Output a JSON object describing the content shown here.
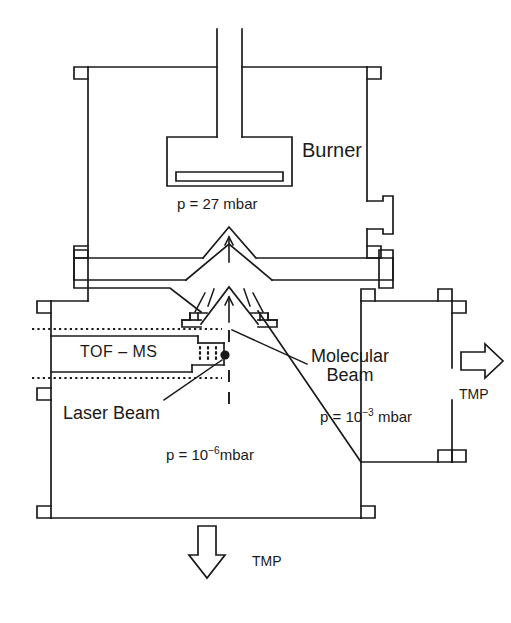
{
  "figure": {
    "type": "schematic-cross-section",
    "background_color": "#ffffff",
    "line_color": "#1a1a1a"
  },
  "labels": {
    "burner": "Burner",
    "tof_ms": "TOF – MS",
    "molecular_beam_line1": "Molecular",
    "molecular_beam_line2": "Beam",
    "laser_beam": "Laser Beam",
    "tmp_right": "TMP",
    "tmp_bottom": "TMP"
  },
  "pressures": {
    "burner_chamber": {
      "prefix": "p = ",
      "value": "27",
      "unit": " mbar",
      "full": "p = 27 mbar"
    },
    "intermediate_chamber": {
      "prefix": "p = 10",
      "exponent": "−3",
      "unit": " mbar",
      "full": "p = 10⁻³ mbar"
    },
    "detection_chamber": {
      "prefix": "p = 10",
      "exponent": "−6",
      "unit": "mbar",
      "full": "p = 10⁻⁶ mbar"
    }
  },
  "components": {
    "burner_stem": "burner-stem-tube",
    "burner_head": "burner-head-block",
    "burner_slot": "burner-surface-slot",
    "nozzle_cone": "sampling-nozzle-cone",
    "nozzle_plate": "nozzle-flange-plate",
    "skimmer_cone": "skimmer-cone",
    "skimmer_mount_left": "skimmer-mount-left",
    "skimmer_mount_right": "skimmer-mount-right",
    "tof_tube": "tof-flight-tube",
    "ion_optics_grid": "ion-extraction-grid",
    "interaction_point": "laser-molecular-beam-interaction-point",
    "beam_axis": "molecular-beam-axis-dashed",
    "laser_axis_upper": "laser-axis-dashed-upper",
    "laser_axis_lower": "laser-axis-dashed-lower",
    "chamber_upper": "burner-chamber-vessel",
    "chamber_lower": "detection-chamber-vessel",
    "chamber_right": "pumping-chamber-vessel",
    "side_port": "upper-chamber-side-port",
    "pump_arrow_right": "tmp-pump-arrow-right",
    "pump_arrow_bottom": "tmp-pump-arrow-bottom"
  },
  "flange_count": {
    "upper_chamber": 4,
    "lower_chamber": 4,
    "right_chamber": 4
  }
}
